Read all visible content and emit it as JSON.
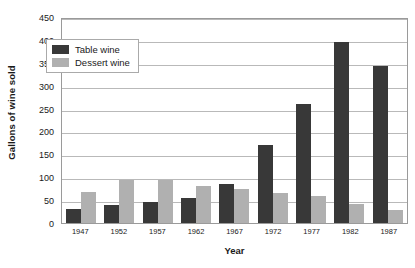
{
  "chart_data": {
    "type": "bar",
    "title": "",
    "xlabel": "Year",
    "ylabel": "Gallons of wine sold",
    "categories": [
      "1947",
      "1952",
      "1957",
      "1962",
      "1967",
      "1972",
      "1977",
      "1982",
      "1987"
    ],
    "series": [
      {
        "name": "Table wine",
        "color": "#383838",
        "values": [
          30,
          40,
          45,
          55,
          85,
          170,
          260,
          395,
          342
        ]
      },
      {
        "name": "Dessert wine",
        "color": "#b0b0b0",
        "values": [
          68,
          95,
          95,
          80,
          75,
          65,
          58,
          42,
          28
        ]
      }
    ],
    "ylim": [
      0,
      450
    ],
    "ytick_step": 50,
    "yticks": [
      "0",
      "50",
      "100",
      "150",
      "200",
      "250",
      "300",
      "350",
      "400",
      "450"
    ],
    "grid": true,
    "grid_axis": "y",
    "legend_position": "upper-left-inside",
    "frame": true
  }
}
